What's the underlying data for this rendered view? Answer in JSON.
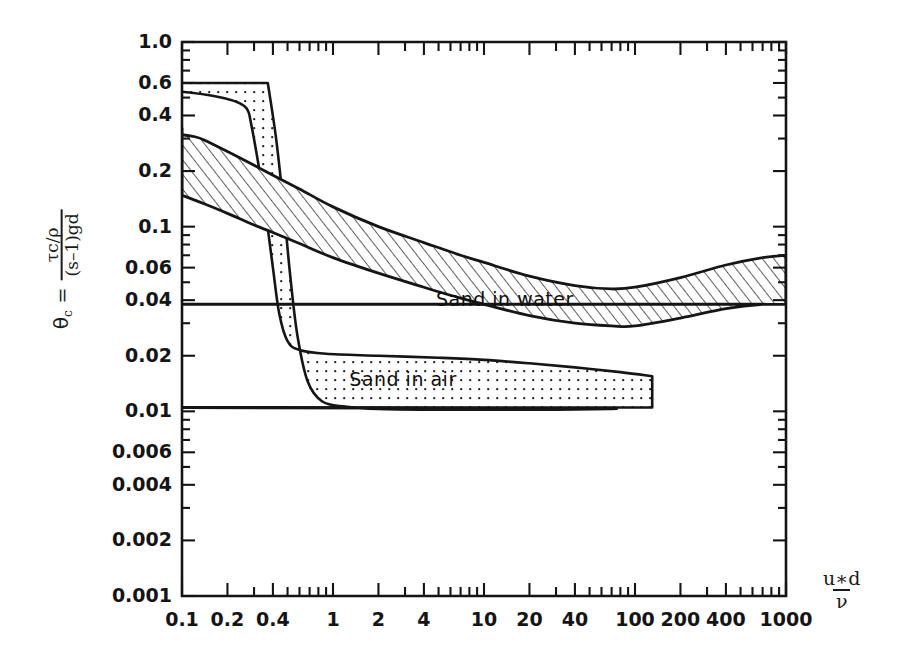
{
  "figure": {
    "background_color": "#ffffff",
    "ink_color": "#141414"
  },
  "axis_titles": {
    "y_symbol": "θ",
    "y_subscript": "c",
    "y_equals": "=",
    "y_numerator": "τc/ρ",
    "y_denominator": "(s–1)gd",
    "x_numerator": "u∗d",
    "x_denominator": "ν"
  },
  "labels": {
    "sand_in_water": "Sand in water",
    "sand_in_air": "Sand in air"
  },
  "chart_data": {
    "type": "line",
    "title": "",
    "subtitle": "",
    "xlabel": "u*d/ν",
    "ylabel": "θc = (τc/ρ) / ((s-1)gd)",
    "xscale": "log",
    "yscale": "log",
    "xlim": [
      0.1,
      1000
    ],
    "ylim": [
      0.001,
      1.0
    ],
    "grid": false,
    "legend": "inline-annotations",
    "xticks": [
      0.1,
      0.2,
      0.4,
      1,
      2,
      4,
      10,
      20,
      40,
      100,
      200,
      400,
      1000
    ],
    "xtick_labels": [
      "0.1",
      "0.2",
      "0.4",
      "1",
      "2",
      "4",
      "10",
      "20",
      "40",
      "100",
      "200",
      "400",
      "1000"
    ],
    "yticks": [
      1.0,
      0.6,
      0.4,
      0.2,
      0.1,
      0.06,
      0.04,
      0.02,
      0.01,
      0.006,
      0.004,
      0.002,
      0.001
    ],
    "ytick_labels": [
      "1.0",
      "0.6",
      "0.4",
      "0.2",
      "0.1",
      "0.06",
      "0.04",
      "0.02",
      "0.01",
      "0.006",
      "0.004",
      "0.002",
      "0.001"
    ],
    "series": [
      {
        "name": "Sand in water",
        "fill": "hatched",
        "upper": [
          [
            0.1,
            0.34
          ],
          [
            0.14,
            0.295
          ],
          [
            0.2,
            0.255
          ],
          [
            0.3,
            0.215
          ],
          [
            0.4,
            0.19
          ],
          [
            0.6,
            0.16
          ],
          [
            1.0,
            0.128
          ],
          [
            2.0,
            0.1
          ],
          [
            4.0,
            0.082
          ],
          [
            7.0,
            0.07
          ],
          [
            10,
            0.064
          ],
          [
            20,
            0.054
          ],
          [
            40,
            0.048
          ],
          [
            70,
            0.046
          ],
          [
            100,
            0.047
          ],
          [
            200,
            0.053
          ],
          [
            400,
            0.062
          ],
          [
            700,
            0.068
          ],
          [
            1000,
            0.07
          ]
        ],
        "lower": [
          [
            0.1,
            0.148
          ],
          [
            0.14,
            0.133
          ],
          [
            0.2,
            0.118
          ],
          [
            0.3,
            0.102
          ],
          [
            0.4,
            0.093
          ],
          [
            0.6,
            0.081
          ],
          [
            1.0,
            0.068
          ],
          [
            2.0,
            0.056
          ],
          [
            4.0,
            0.047
          ],
          [
            7.0,
            0.041
          ],
          [
            10,
            0.038
          ],
          [
            20,
            0.033
          ],
          [
            40,
            0.03
          ],
          [
            70,
            0.029
          ],
          [
            100,
            0.029
          ],
          [
            200,
            0.032
          ],
          [
            400,
            0.036
          ],
          [
            700,
            0.038
          ],
          [
            1000,
            0.038
          ]
        ]
      },
      {
        "name": "Sand in air",
        "fill": "dotted",
        "upper": [
          [
            0.25,
            0.6
          ],
          [
            0.28,
            0.4
          ],
          [
            0.32,
            0.22
          ],
          [
            0.36,
            0.115
          ],
          [
            0.4,
            0.06
          ],
          [
            0.44,
            0.034
          ],
          [
            0.5,
            0.024
          ],
          [
            0.6,
            0.0215
          ],
          [
            0.9,
            0.0205
          ],
          [
            2.0,
            0.02
          ],
          [
            5.0,
            0.0195
          ],
          [
            10,
            0.019
          ],
          [
            20,
            0.0182
          ],
          [
            40,
            0.0173
          ],
          [
            80,
            0.0163
          ],
          [
            130,
            0.0155
          ]
        ],
        "lower": [
          [
            0.37,
            0.6
          ],
          [
            0.42,
            0.3
          ],
          [
            0.47,
            0.13
          ],
          [
            0.52,
            0.055
          ],
          [
            0.58,
            0.026
          ],
          [
            0.68,
            0.0145
          ],
          [
            0.85,
            0.0113
          ],
          [
            1.2,
            0.0106
          ],
          [
            2.0,
            0.0103
          ],
          [
            5.0,
            0.0102
          ],
          [
            10,
            0.0102
          ],
          [
            30,
            0.0102
          ],
          [
            70,
            0.0103
          ],
          [
            130,
            0.0105
          ]
        ]
      }
    ],
    "annotations": [
      {
        "text": "Sand in water",
        "x": 12,
        "y": 0.04
      },
      {
        "text": "Sand in air",
        "x": 3.2,
        "y": 0.0148
      }
    ]
  },
  "axis_geometry": {
    "left_px": 182,
    "right_px": 786,
    "top_px": 42,
    "bottom_px": 596
  }
}
